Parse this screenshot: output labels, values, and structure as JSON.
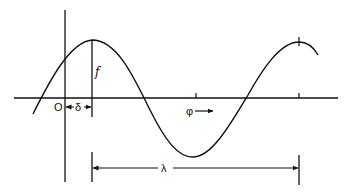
{
  "diagram": {
    "colors": {
      "line": "#111111",
      "background": "#ffffff"
    },
    "labels": {
      "origin": "O",
      "phase_shift": "δ",
      "amplitude": "f",
      "direction": "φ",
      "wavelength": "λ"
    },
    "elements": [
      {
        "id": "horizontal-axis",
        "type": "axis"
      },
      {
        "id": "vertical-axis",
        "type": "axis"
      },
      {
        "id": "sine-wave",
        "type": "curve",
        "peaks": 2,
        "troughs": 1
      },
      {
        "id": "amplitude-line",
        "type": "line",
        "label": "f"
      },
      {
        "id": "phase-shift-marker",
        "type": "dimension",
        "label": "δ"
      },
      {
        "id": "direction-arrow",
        "type": "arrow",
        "label": "φ"
      },
      {
        "id": "wavelength-marker",
        "type": "dimension",
        "label": "λ"
      }
    ]
  }
}
